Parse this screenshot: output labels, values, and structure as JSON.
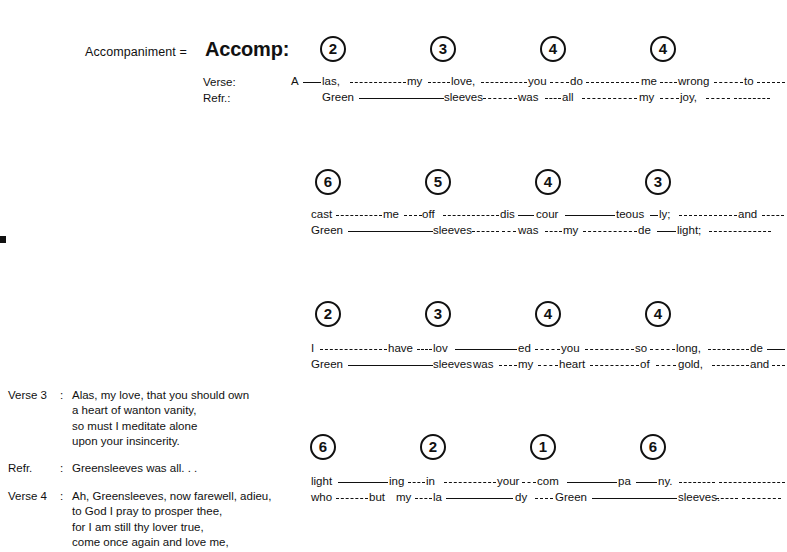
{
  "header": {
    "accompaniment_equation": "Accompaniment =",
    "accomp_abbrev": "Accomp:"
  },
  "row_labels": {
    "verse": "Verse:",
    "refrain": "Refr.:"
  },
  "systems": [
    {
      "id": "system-1",
      "chords": [
        "2",
        "3",
        "4",
        "4"
      ],
      "verse_text": "A— las,- - - - - - - -my- - - love,- - - - - -you- - -do - - - - - - - me - - - wrong - - - - - to - - - -",
      "refrain_text": "Green ——————sleeves - - - - -was- - -all - - - - - - - -my- - - joy,- - - - - - - - - - - -",
      "verse_syllables": [
        "A",
        "las,",
        "my",
        "love,",
        "you",
        "do",
        "me",
        "wrong",
        "to"
      ],
      "refrain_syllables": [
        "Green",
        "sleeves",
        "was",
        "all",
        "my",
        "joy,"
      ]
    },
    {
      "id": "system-2",
      "chords": [
        "6",
        "5",
        "4",
        "3"
      ],
      "verse_text": "cast - - - - - - -me - - -off - - - - - - - - - dis — cour ———— teous – ly;- - - - - - - - - and - - -",
      "refrain_text": "Green ——————sleeves - - - - - - was - - -my - - - - - - -de —— light;- - - - - - - - - - - - -",
      "verse_syllables": [
        "cast",
        "me",
        "off",
        "dis",
        "cour",
        "teous",
        "ly;",
        "and"
      ],
      "refrain_syllables": [
        "Green",
        "sleeves",
        "was",
        "my",
        "de",
        "light;"
      ]
    },
    {
      "id": "system-3",
      "chords": [
        "2",
        "3",
        "4",
        "4"
      ],
      "verse_text": "I - - - - - - - - - -have- - -lov ————— ed - - - -you - - - - - - - -so - - - -long,- - - - - - - de ——",
      "refrain_text": "Green ——————sleeves was - - -my- - - heart- - - - - - - -of - - - gold,- - - - - - and - - -",
      "verse_syllables": [
        "I",
        "have",
        "lov",
        "ed",
        "you",
        "so",
        "long,",
        "de"
      ],
      "refrain_syllables": [
        "Green",
        "sleeves",
        "was",
        "my",
        "heart",
        "of",
        "gold,",
        "and"
      ]
    },
    {
      "id": "system-4",
      "chords": [
        "6",
        "2",
        "1",
        "6"
      ],
      "verse_text": "light ———— ing - - -in - - - - - - -your- - com ———— pa —— ny.- - - - - - - - - - - -",
      "refrain_text": "who- - - -but my- - -la ————— dy - - -Green ————— sleeves.- - - - - - - - -",
      "verse_syllables": [
        "light",
        "ing",
        "in",
        "your",
        "com",
        "pa",
        "ny."
      ],
      "refrain_syllables": [
        "who",
        "but",
        "my",
        "la",
        "dy",
        "Green",
        "sleeves."
      ]
    }
  ],
  "verse_block": [
    {
      "label": "Verse 3",
      "colon": ":",
      "lines": [
        "Alas, my love, that you should own",
        "a heart of wanton vanity,",
        "so must I meditate alone",
        "upon your insincerity."
      ]
    },
    {
      "label": "Refr.",
      "colon": ":",
      "lines": [
        "Greensleeves was all. . ."
      ]
    },
    {
      "label": "Verse 4",
      "colon": ":",
      "lines": [
        "Ah, Greensleeves, now farewell, adieu,",
        "to God I pray to prosper thee,",
        "for I am still thy lover true,",
        "come once again and love me,"
      ]
    }
  ],
  "colors": {
    "ink": "#111111",
    "page": "#ffffff"
  },
  "layout": {
    "system_tops": [
      0,
      133,
      265,
      398
    ],
    "chord_x": [
      325,
      435,
      545,
      655
    ],
    "chord_x_alt": [
      318,
      428,
      538,
      648
    ]
  }
}
